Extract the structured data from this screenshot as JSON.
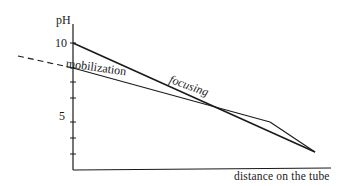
{
  "diagram": {
    "y_axis_label": "pH",
    "x_axis_label": "distance on the tube",
    "y_ticks": [
      {
        "label": "10",
        "value": 10
      },
      {
        "label": "5",
        "value": 5
      }
    ],
    "curves": [
      {
        "name": "focusing",
        "label": "focusing",
        "style": "solid",
        "start_pH": 10,
        "description": "steeper line from pH 10 down to the end of the tube"
      },
      {
        "name": "mobilization",
        "label": "mobilization",
        "style": "solid",
        "start_pH": 8.5,
        "extension": "dashed line extending beyond the y-axis to the left",
        "description": "shallower line converging with focusing line near the end of the tube"
      }
    ],
    "colors": {
      "line": "#1a1a1a",
      "background": "#ffffff"
    }
  }
}
